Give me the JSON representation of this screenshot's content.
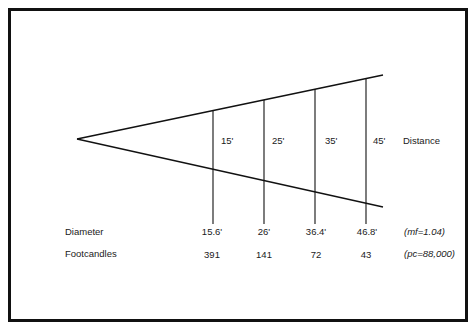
{
  "diagram": {
    "distance_label": "Distance",
    "distances": [
      "15'",
      "25'",
      "35'",
      "45'"
    ],
    "rows": {
      "diameter": {
        "label": "Diameter",
        "values": [
          "15.6'",
          "26'",
          "36.4'",
          "46.8'"
        ],
        "note": "(mf=1.04)"
      },
      "footcandles": {
        "label": "Footcandles",
        "values": [
          "391",
          "141",
          "72",
          "43"
        ],
        "note": "(pc=88,000)"
      }
    },
    "colors": {
      "line": "#111111",
      "text": "#1a1a1a",
      "background": "#ffffff"
    }
  }
}
